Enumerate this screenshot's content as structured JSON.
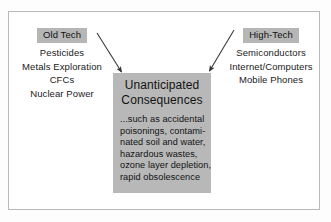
{
  "diagram": {
    "title_left": "Old Tech",
    "title_right": "High-Tech",
    "left_column": {
      "header": "Old Tech",
      "items": [
        "Pesticides",
        "Metals Exploration",
        "CFCs",
        "Nuclear Power"
      ]
    },
    "right_column": {
      "header": "High-Tech",
      "items": [
        "Semiconductors",
        "Internet/Computers",
        "Mobile Phones"
      ]
    },
    "center": {
      "title_line1": "Unanticipated",
      "title_line2": "Consequences",
      "body_lines": [
        "...such as accidental",
        "poisonings, contami-",
        "nated soil and water,",
        "hazardous wastes,",
        "ozone layer depletion,",
        "rapid obsolescence"
      ]
    },
    "arrows": [
      {
        "name": "arrow-old-tech-to-center",
        "from": "Old Tech",
        "to": "Unanticipated Consequences"
      },
      {
        "name": "arrow-high-tech-to-center",
        "from": "High-Tech",
        "to": "Unanticipated Consequences"
      }
    ],
    "colors": {
      "highlight": "#b6b6b6",
      "center_box": "#b8b8b8",
      "frame_border": "#b9b9b9",
      "text": "#1a1a1a",
      "background": "#ffffff"
    }
  }
}
